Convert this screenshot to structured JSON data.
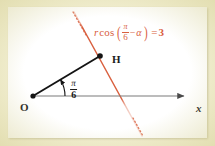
{
  "figure": {
    "caption_equation": {
      "r": "r",
      "cos": "cos",
      "open_paren": "(",
      "fraction_numerator": "π",
      "fraction_denominator": "6",
      "minus": "−",
      "alpha": "α",
      "close_paren": ")",
      "equals": "=",
      "value": "3",
      "plain_text": "r cos(π/6 − α) = 3",
      "color": "#d9603f"
    },
    "points": {
      "origin_label": "O",
      "foot_label": "H",
      "axis_label": "x"
    },
    "angle": {
      "numerator": "π",
      "denominator": "6",
      "plain_text": "π/6"
    },
    "colors": {
      "line_orange": "#d9603f",
      "ray_black": "#141414",
      "axis_gray": "#7a7a7a",
      "panel_background": "#ffffff",
      "page_background": "#f2efd2"
    },
    "geometry": {
      "origin": [
        33,
        96
      ],
      "foot_point": [
        99,
        56
      ],
      "axis_end": [
        186,
        96
      ],
      "polar_line_start": [
        73,
        12
      ],
      "polar_line_end": [
        141,
        134
      ]
    }
  }
}
